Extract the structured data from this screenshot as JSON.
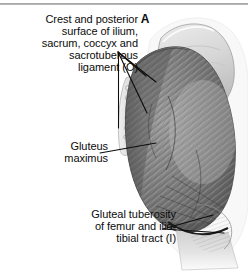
{
  "figure": {
    "domain_type": "anatomical-illustration",
    "panel_letter": "A",
    "rendering": "grayscale halftone",
    "colors": {
      "background": "#ffffff",
      "text": "#0b0b0b",
      "leader_line": "#0d0d0d",
      "muscle_mid": "#8a8a8a",
      "muscle_dark": "#555555",
      "muscle_light": "#b5b5b5",
      "bone_light": "#d8d8d8",
      "outline": "#6f6f6f",
      "top_rule": "#9a9a9a"
    }
  },
  "labels": {
    "origin": "Crest and posterior\nsurface of ilium,\nsacrum, coccyx and\nsacrotuberous\nligament (O)",
    "muscle": "Gluteus\nmaximus",
    "insertion": "Gluteal tuberosity\nof femur and ilio-\ntibial tract (I)"
  },
  "leader_lines": {
    "origin_count": 3,
    "muscle_count": 1,
    "insertion_count": 2,
    "origin_bracket": "vertical"
  }
}
